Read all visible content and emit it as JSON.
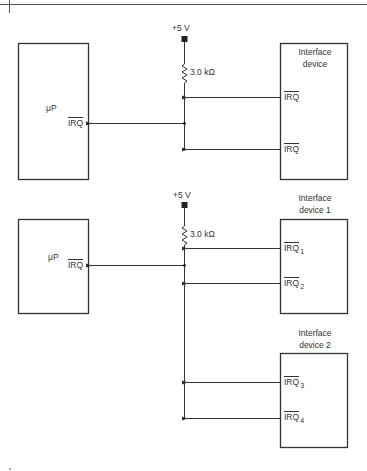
{
  "figure": {
    "top_circuit": {
      "supply": "+5 V",
      "resistor": "3.0 kΩ",
      "processor": {
        "name": "μP",
        "pin": "IRQ"
      },
      "device": {
        "title_line1": "Interface",
        "title_line2": "device",
        "pins": [
          "IRQ",
          "IRQ"
        ]
      }
    },
    "bottom_circuit": {
      "supply": "+5 V",
      "resistor": "3.0 kΩ",
      "processor": {
        "name": "μP",
        "pin": "IRQ"
      },
      "device1": {
        "title_line1": "Interface",
        "title_line2": "device 1",
        "pins": [
          {
            "base": "IRQ",
            "sub": "1"
          },
          {
            "base": "IRQ",
            "sub": "2"
          }
        ]
      },
      "device2": {
        "title_line1": "Interface",
        "title_line2": "device 2",
        "pins": [
          {
            "base": "IRQ",
            "sub": "3"
          },
          {
            "base": "IRQ",
            "sub": "4"
          }
        ]
      }
    }
  }
}
